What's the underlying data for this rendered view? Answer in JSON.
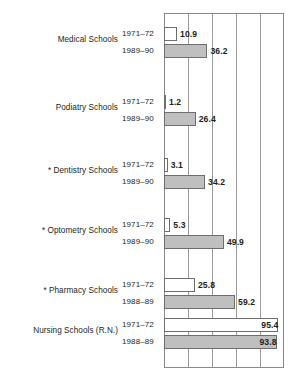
{
  "chart_data": {
    "type": "bar",
    "title": "",
    "subtitle": "",
    "xlabel": "",
    "ylabel": "",
    "orientation": "horizontal",
    "xlim": [
      0,
      100
    ],
    "xticks": [
      0,
      20,
      40,
      60,
      80,
      100
    ],
    "tick_labels_shown": false,
    "grid": true,
    "grid_axis": "x",
    "legend": null,
    "legend_position": "none",
    "colors": {
      "series_1971_72": "#ffffff",
      "series_later": "#bfbfbf",
      "bar_outline": "#6d6d6d",
      "axis": "#8a8a8a",
      "gridline": "#9a9a9a",
      "text": "#231f20"
    },
    "categories": [
      "Medical Schools",
      "Podiatry Schools",
      "Dentistry Schools",
      "Optometry Schools",
      "Pharmacy Schools",
      "Nursing Schools (R.N.)"
    ],
    "series": [
      {
        "name": "1971–72",
        "values": [
          10.9,
          1.2,
          3.1,
          5.3,
          25.8,
          95.4
        ]
      },
      {
        "name": "Later year",
        "values": [
          36.2,
          26.4,
          34.2,
          49.9,
          59.2,
          93.8
        ]
      }
    ],
    "groups": [
      {
        "category": "Medical Schools",
        "asterisk": false,
        "rows": [
          {
            "year": "1971–72",
            "value": 10.9,
            "value_label": "10.9",
            "style": "open",
            "label_position": "outside"
          },
          {
            "year": "1989–90",
            "value": 36.2,
            "value_label": "36.2",
            "style": "filled",
            "label_position": "outside"
          }
        ]
      },
      {
        "category": "Podiatry Schools",
        "asterisk": false,
        "rows": [
          {
            "year": "1971–72",
            "value": 1.2,
            "value_label": "1.2",
            "style": "open",
            "label_position": "outside"
          },
          {
            "year": "1989–90",
            "value": 26.4,
            "value_label": "26.4",
            "style": "filled",
            "label_position": "outside"
          }
        ]
      },
      {
        "category": "Dentistry Schools",
        "asterisk": true,
        "rows": [
          {
            "year": "1971–72",
            "value": 3.1,
            "value_label": "3.1",
            "style": "open",
            "label_position": "outside"
          },
          {
            "year": "1989–90",
            "value": 34.2,
            "value_label": "34.2",
            "style": "filled",
            "label_position": "outside"
          }
        ]
      },
      {
        "category": "Optometry Schools",
        "asterisk": true,
        "rows": [
          {
            "year": "1971–72",
            "value": 5.3,
            "value_label": "5.3",
            "style": "open",
            "label_position": "outside"
          },
          {
            "year": "1989–90",
            "value": 49.9,
            "value_label": "49.9",
            "style": "filled",
            "label_position": "outside"
          }
        ]
      },
      {
        "category": "Pharmacy Schools",
        "asterisk": true,
        "rows": [
          {
            "year": "1971–72",
            "value": 25.8,
            "value_label": "25.8",
            "style": "open",
            "label_position": "outside"
          },
          {
            "year": "1988–89",
            "value": 59.2,
            "value_label": "59.2",
            "style": "filled",
            "label_position": "outside"
          }
        ]
      },
      {
        "category": "Nursing Schools (R.N.)",
        "asterisk": false,
        "rows": [
          {
            "year": "1971–72",
            "value": 95.4,
            "value_label": "95.4",
            "style": "open",
            "label_position": "inside"
          },
          {
            "year": "1988–89",
            "value": 93.8,
            "value_label": "93.8",
            "style": "filled",
            "label_position": "inside"
          }
        ]
      }
    ]
  },
  "layout": {
    "plot_left": 164,
    "plot_top": 13,
    "plot_width": 120,
    "plot_height": 355,
    "bar_height": 14,
    "group_tops": [
      27,
      95,
      158,
      218,
      278,
      318
    ],
    "row_gap": 17,
    "asterisk_glyph": "*"
  }
}
